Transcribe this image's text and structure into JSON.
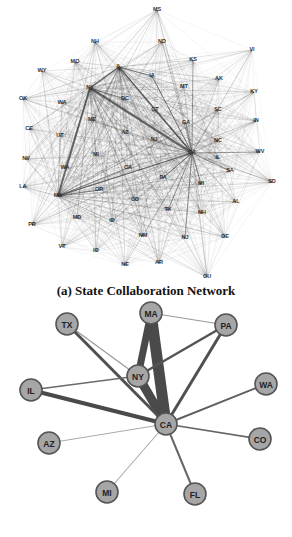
{
  "figure": {
    "caption": "(a) State Collaboration Network"
  },
  "top_network": {
    "hubs": [
      "NY",
      "CA",
      "MA",
      "IL"
    ],
    "nodes": [
      {
        "id": "MS",
        "x": 157,
        "y": 10
      },
      {
        "id": "NH",
        "x": 95,
        "y": 42
      },
      {
        "id": "ND",
        "x": 162,
        "y": 42
      },
      {
        "id": "VI",
        "x": 252,
        "y": 50
      },
      {
        "id": "MO",
        "x": 75,
        "y": 62
      },
      {
        "id": "KS",
        "x": 193,
        "y": 60
      },
      {
        "id": "WY",
        "x": 42,
        "y": 71
      },
      {
        "id": "IL",
        "x": 119,
        "y": 67
      },
      {
        "id": "AK",
        "x": 219,
        "y": 79
      },
      {
        "id": "IA",
        "x": 152,
        "y": 76
      },
      {
        "id": "MT",
        "x": 184,
        "y": 87
      },
      {
        "id": "KY",
        "x": 254,
        "y": 92
      },
      {
        "id": "NY",
        "x": 90,
        "y": 88
      },
      {
        "id": "OK",
        "x": 23,
        "y": 99
      },
      {
        "id": "DC",
        "x": 125,
        "y": 99
      },
      {
        "id": "WA",
        "x": 62,
        "y": 103
      },
      {
        "id": "SC",
        "x": 218,
        "y": 110
      },
      {
        "id": "CT",
        "x": 155,
        "y": 110
      },
      {
        "id": "ME",
        "x": 92,
        "y": 120
      },
      {
        "id": "IN",
        "x": 256,
        "y": 121
      },
      {
        "id": "AZ",
        "x": 125,
        "y": 133
      },
      {
        "id": "CE",
        "x": 29,
        "y": 129
      },
      {
        "id": "LT",
        "x": 60,
        "y": 136
      },
      {
        "id": "GA",
        "x": 186,
        "y": 123
      },
      {
        "id": "NJ2",
        "x": 154,
        "y": 140
      },
      {
        "id": "MC",
        "x": 218,
        "y": 141
      },
      {
        "id": "MI",
        "x": 96,
        "y": 155
      },
      {
        "id": "IL2",
        "x": 218,
        "y": 158
      },
      {
        "id": "CA",
        "x": 192,
        "y": 153
      },
      {
        "id": "WV",
        "x": 260,
        "y": 152
      },
      {
        "id": "NV",
        "x": 26,
        "y": 159
      },
      {
        "id": "WA2",
        "x": 65,
        "y": 168
      },
      {
        "id": "CA2",
        "x": 128,
        "y": 168
      },
      {
        "id": "PA",
        "x": 163,
        "y": 178
      },
      {
        "id": "OR",
        "x": 99,
        "y": 190
      },
      {
        "id": "SA",
        "x": 230,
        "y": 171
      },
      {
        "id": "SD",
        "x": 272,
        "y": 182
      },
      {
        "id": "LA",
        "x": 23,
        "y": 187
      },
      {
        "id": "MA",
        "x": 58,
        "y": 196
      },
      {
        "id": "MI2",
        "x": 201,
        "y": 184
      },
      {
        "id": "CO",
        "x": 135,
        "y": 200
      },
      {
        "id": "AL",
        "x": 236,
        "y": 202
      },
      {
        "id": "TX",
        "x": 168,
        "y": 210
      },
      {
        "id": "MD",
        "x": 77,
        "y": 218
      },
      {
        "id": "ID",
        "x": 112,
        "y": 221
      },
      {
        "id": "NH2",
        "x": 202,
        "y": 213
      },
      {
        "id": "PR",
        "x": 32,
        "y": 225
      },
      {
        "id": "NM",
        "x": 143,
        "y": 236
      },
      {
        "id": "NJ",
        "x": 185,
        "y": 238
      },
      {
        "id": "DE",
        "x": 225,
        "y": 237
      },
      {
        "id": "VT",
        "x": 62,
        "y": 247
      },
      {
        "id": "IO",
        "x": 96,
        "y": 251
      },
      {
        "id": "NE",
        "x": 125,
        "y": 265
      },
      {
        "id": "AR",
        "x": 159,
        "y": 263
      },
      {
        "id": "GU",
        "x": 207,
        "y": 277
      }
    ],
    "labels": {
      "MS": "MS",
      "NH": "NH",
      "ND": "ND",
      "VI": "VI",
      "MO": "MO",
      "KS": "KS",
      "WY": "WY",
      "IL": "IL",
      "AK": "AK",
      "IA": "IA",
      "MT": "MT",
      "KY": "KY",
      "NY": "NY",
      "OK": "OK",
      "DC": "DC",
      "WA": "WA",
      "SC": "SC",
      "CT": "CT",
      "ME": "ME",
      "IN": "IN",
      "AZ": "AZ",
      "CE": "CE",
      "LT": "UT",
      "GA": "GA",
      "NJ2": "NJ",
      "MC": "NC",
      "MI": "MI",
      "IL2": "IL",
      "CA": "CA",
      "WV": "WV",
      "NV": "NV",
      "WA2": "WA",
      "CA2": "CA",
      "PA": "PA",
      "OR": "OR",
      "SA": "SA",
      "SD": "SD",
      "LA": "LA",
      "MA": "MA",
      "MI2": "MI",
      "CO": "CO",
      "AL": "AL",
      "TX": "TX",
      "MD": "MD",
      "ID": "ID",
      "NH2": "NH",
      "PR": "PR",
      "NM": "NM",
      "NJ": "NJ",
      "DE": "DE",
      "VT": "VT",
      "IO": "IO",
      "NE": "NE",
      "AR": "AR",
      "GU": "GU"
    },
    "strong_edges": [
      [
        "NY",
        "CA",
        3.2
      ],
      [
        "NY",
        "MA",
        2.6
      ],
      [
        "NY",
        "IL",
        2.2
      ],
      [
        "IL",
        "CA",
        2.0
      ],
      [
        "MA",
        "CA",
        1.8
      ],
      [
        "IL",
        "IA",
        1.2
      ],
      [
        "IA",
        "CA",
        1.2
      ],
      [
        "NY",
        "DC",
        1.0
      ],
      [
        "MA",
        "CA2",
        1.0
      ],
      [
        "CA",
        "PA",
        1.0
      ],
      [
        "CA",
        "NJ",
        1.0
      ],
      [
        "CA",
        "MI2",
        1.0
      ],
      [
        "CA",
        "TX",
        0.9
      ],
      [
        "CA",
        "SA",
        0.9
      ],
      [
        "CA",
        "WV",
        0.8
      ],
      [
        "CA",
        "KS",
        0.8
      ],
      [
        "CA",
        "GA",
        0.8
      ],
      [
        "MA",
        "OR",
        0.8
      ],
      [
        "NY",
        "WA2",
        0.8
      ]
    ]
  },
  "bottom_network": {
    "node_fill": "#a6a6a6",
    "node_stroke": "#555555",
    "edge_color": "#555555",
    "nodes": [
      {
        "id": "MA",
        "label": "MA",
        "x": 151,
        "y": 13
      },
      {
        "id": "TX",
        "label": "TX",
        "x": 67,
        "y": 24
      },
      {
        "id": "PA",
        "label": "PA",
        "x": 226,
        "y": 25
      },
      {
        "id": "NY",
        "label": "NY",
        "x": 138,
        "y": 76
      },
      {
        "id": "IL",
        "label": "IL",
        "x": 31,
        "y": 90
      },
      {
        "id": "WA",
        "label": "WA",
        "x": 266,
        "y": 84
      },
      {
        "id": "CA",
        "label": "CA",
        "x": 166,
        "y": 124
      },
      {
        "id": "AZ",
        "label": "AZ",
        "x": 49,
        "y": 143
      },
      {
        "id": "CO",
        "label": "CO",
        "x": 260,
        "y": 139
      },
      {
        "id": "MI",
        "label": "MI",
        "x": 107,
        "y": 192
      },
      {
        "id": "FL",
        "label": "FL",
        "x": 195,
        "y": 194
      }
    ],
    "edges": [
      {
        "from": "MA",
        "to": "CA",
        "width": 11,
        "color": "#4a4a4a"
      },
      {
        "from": "MA",
        "to": "NY",
        "width": 7,
        "color": "#4a4a4a"
      },
      {
        "from": "NY",
        "to": "CA",
        "width": 9,
        "color": "#4a4a4a"
      },
      {
        "from": "MA",
        "to": "PA",
        "width": 1.2,
        "color": "#9a9a9a"
      },
      {
        "from": "TX",
        "to": "NY",
        "width": 1.2,
        "color": "#9a9a9a"
      },
      {
        "from": "TX",
        "to": "CA",
        "width": 3,
        "color": "#505050"
      },
      {
        "from": "PA",
        "to": "NY",
        "width": 2.5,
        "color": "#555555"
      },
      {
        "from": "PA",
        "to": "CA",
        "width": 3,
        "color": "#505050"
      },
      {
        "from": "IL",
        "to": "NY",
        "width": 1.5,
        "color": "#6a6a6a"
      },
      {
        "from": "IL",
        "to": "CA",
        "width": 4,
        "color": "#4a4a4a"
      },
      {
        "from": "WA",
        "to": "CA",
        "width": 2,
        "color": "#606060"
      },
      {
        "from": "AZ",
        "to": "CA",
        "width": 1,
        "color": "#aaaaaa"
      },
      {
        "from": "CO",
        "to": "CA",
        "width": 1.6,
        "color": "#666666"
      },
      {
        "from": "MI",
        "to": "CA",
        "width": 1.1,
        "color": "#aaaaaa"
      },
      {
        "from": "FL",
        "to": "CA",
        "width": 2,
        "color": "#666666"
      }
    ]
  }
}
